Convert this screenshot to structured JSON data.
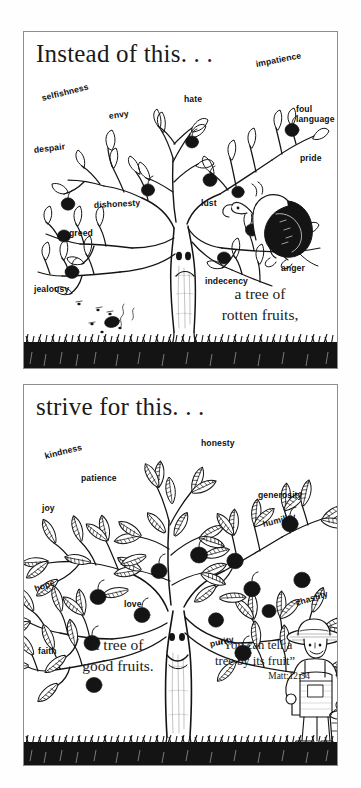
{
  "poster": {
    "background_color": "#ffffff",
    "ink_color": "#111111",
    "border_color": "#8d8d8d"
  },
  "panels": [
    {
      "id": "instead-of-this",
      "heading": "Instead of this. . .",
      "caption": "a tree of\nrotten fruits,",
      "tree_kind": "bare tree with rotten fruits",
      "tree_face": "frowning-face",
      "creature": "vulture",
      "labels": [
        {
          "text": "selfishness",
          "x": 18,
          "y": 62,
          "rotate": -14
        },
        {
          "text": "envy",
          "x": 85,
          "y": 80,
          "rotate": -8
        },
        {
          "text": "hate",
          "x": 160,
          "y": 63,
          "rotate": 0
        },
        {
          "text": "impatience",
          "x": 232,
          "y": 28,
          "rotate": -11
        },
        {
          "text": "foul\nlanguage",
          "x": 272,
          "y": 73,
          "rotate": 0
        },
        {
          "text": "despair",
          "x": 10,
          "y": 114,
          "rotate": -7
        },
        {
          "text": "pride",
          "x": 276,
          "y": 122,
          "rotate": 0
        },
        {
          "text": "lust",
          "x": 177,
          "y": 167,
          "rotate": 0
        },
        {
          "text": "dishonesty",
          "x": 70,
          "y": 169,
          "rotate": -3
        },
        {
          "text": "greed",
          "x": 45,
          "y": 197,
          "rotate": 0
        },
        {
          "text": "anger",
          "x": 257,
          "y": 232,
          "rotate": 0
        },
        {
          "text": "indecency",
          "x": 181,
          "y": 245,
          "rotate": 0
        },
        {
          "text": "jealousy",
          "x": 10,
          "y": 253,
          "rotate": 0
        }
      ]
    },
    {
      "id": "strive-for-this",
      "heading": "strive for this. . .",
      "caption": "a tree of\ngood fruits.",
      "tree_kind": "leafy tree with good fruits",
      "tree_face": "smiling-face",
      "creature": "farmer with bucket",
      "verse": {
        "text": "“You can tell a\ntree by its fruit”",
        "reference": "Matt:12:34"
      },
      "labels": [
        {
          "text": "kindness",
          "x": 21,
          "y": 67,
          "rotate": -14
        },
        {
          "text": "patience",
          "x": 57,
          "y": 89,
          "rotate": 0
        },
        {
          "text": "honesty",
          "x": 177,
          "y": 54,
          "rotate": 0
        },
        {
          "text": "generosity",
          "x": 234,
          "y": 106,
          "rotate": 0
        },
        {
          "text": "joy",
          "x": 18,
          "y": 119,
          "rotate": 0
        },
        {
          "text": "humility",
          "x": 239,
          "y": 135,
          "rotate": -14
        },
        {
          "text": "hope",
          "x": 11,
          "y": 200,
          "rotate": -20
        },
        {
          "text": "love",
          "x": 100,
          "y": 215,
          "rotate": 0
        },
        {
          "text": "chastity",
          "x": 272,
          "y": 214,
          "rotate": -17
        },
        {
          "text": "faith",
          "x": 14,
          "y": 262,
          "rotate": 0
        },
        {
          "text": "purity",
          "x": 186,
          "y": 255,
          "rotate": -12
        }
      ]
    }
  ]
}
